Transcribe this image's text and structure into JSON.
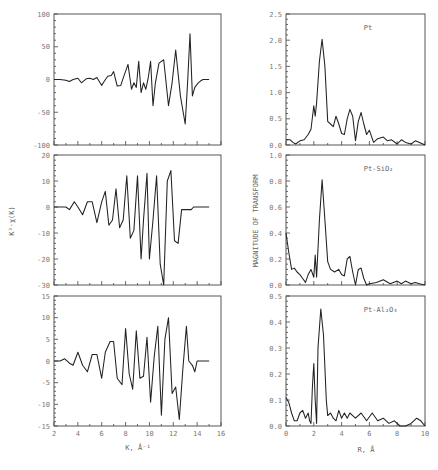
{
  "figure": {
    "left_column": {
      "y_axis_title": "K³·χ(K)",
      "x_axis_title": "K, Å⁻¹"
    },
    "right_column": {
      "y_axis_title": "MAGNITUDE OF TRANSFORM",
      "x_axis_title": "R, Å"
    }
  },
  "chart_data": [
    {
      "type": "line",
      "title": "",
      "panel": "left-top",
      "xlabel": "K, Å⁻¹",
      "ylabel": "K³·χ(K)",
      "xlim": [
        2,
        16
      ],
      "ylim": [
        -100,
        100
      ],
      "xticks": [
        2,
        4,
        6,
        8,
        10,
        12,
        14,
        16
      ],
      "yticks": [
        -100,
        -50,
        0,
        50,
        100
      ],
      "grid": false,
      "x": [
        2.0,
        2.5,
        3.0,
        3.3,
        3.6,
        4.0,
        4.3,
        4.7,
        5.0,
        5.3,
        5.6,
        6.0,
        6.2,
        6.5,
        6.8,
        7.0,
        7.3,
        7.6,
        7.8,
        8.2,
        8.5,
        8.7,
        8.9,
        9.1,
        9.3,
        9.5,
        9.7,
        9.9,
        10.1,
        10.3,
        10.5,
        10.8,
        11.2,
        11.6,
        11.9,
        12.2,
        12.6,
        13.0,
        13.2,
        13.4,
        13.6,
        13.8,
        14.1,
        14.3,
        14.5,
        14.7,
        15.0
      ],
      "y": [
        0,
        0,
        -1,
        -3,
        0,
        2,
        -5,
        1,
        2,
        0,
        3,
        -9,
        -3,
        5,
        6,
        12,
        -10,
        -9,
        2,
        23,
        -15,
        -5,
        -12,
        28,
        -20,
        -5,
        -15,
        2,
        28,
        -40,
        -5,
        25,
        30,
        -40,
        -5,
        45,
        -25,
        -68,
        -5,
        70,
        -25,
        -12,
        -5,
        -2,
        0,
        0,
        0
      ],
      "series_name": "Pt"
    },
    {
      "type": "line",
      "panel": "left-middle",
      "xlabel": "K, Å⁻¹",
      "ylabel": "K³·χ(K)",
      "xlim": [
        2,
        16
      ],
      "ylim": [
        -30,
        20
      ],
      "xticks": [
        2,
        4,
        6,
        8,
        10,
        12,
        14,
        16
      ],
      "yticks": [
        -30,
        -20,
        -10,
        0,
        10,
        20
      ],
      "grid": false,
      "x": [
        2.0,
        2.5,
        3.0,
        3.3,
        3.7,
        4.0,
        4.4,
        4.8,
        5.2,
        5.6,
        6.0,
        6.3,
        6.6,
        6.9,
        7.2,
        7.5,
        7.8,
        8.1,
        8.4,
        8.7,
        9.0,
        9.3,
        9.5,
        9.8,
        10.0,
        10.3,
        10.6,
        10.9,
        11.2,
        11.5,
        11.8,
        12.1,
        12.4,
        12.7,
        13.0,
        13.2,
        13.5,
        13.7,
        13.9,
        14.1,
        14.3,
        14.5,
        14.7,
        15.0
      ],
      "y": [
        0,
        0,
        0,
        -1,
        2,
        0,
        -3,
        2,
        2,
        -6,
        2,
        6,
        -7,
        -5,
        7,
        -8,
        -5,
        12,
        -12,
        -9,
        12,
        -20,
        -5,
        13,
        -20,
        -5,
        12,
        -22,
        -30,
        10,
        14,
        -13,
        -14,
        -1,
        -1,
        -1,
        -1,
        0,
        0,
        0,
        0,
        0,
        0,
        0
      ],
      "series_name": "Pt-SiO₂"
    },
    {
      "type": "line",
      "panel": "left-bottom",
      "xlabel": "K, Å⁻¹",
      "ylabel": "K³·χ(K)",
      "xlim": [
        2,
        16
      ],
      "ylim": [
        -15,
        15
      ],
      "xticks": [
        2,
        4,
        6,
        8,
        10,
        12,
        14,
        16
      ],
      "yticks": [
        -15,
        -10,
        -5,
        0,
        5,
        10,
        15
      ],
      "grid": false,
      "x": [
        2.0,
        2.5,
        2.9,
        3.3,
        3.6,
        4.0,
        4.4,
        4.8,
        5.2,
        5.6,
        6.0,
        6.3,
        6.7,
        7.0,
        7.3,
        7.7,
        8.0,
        8.3,
        8.6,
        8.9,
        9.2,
        9.5,
        9.8,
        10.1,
        10.4,
        10.7,
        11.0,
        11.3,
        11.6,
        11.9,
        12.2,
        12.5,
        12.8,
        13.1,
        13.3,
        13.6,
        13.8,
        14.0,
        14.2,
        14.4,
        14.6,
        14.8,
        15.0
      ],
      "y": [
        0,
        0,
        0.5,
        -0.5,
        -1,
        2,
        -1,
        -2.5,
        1.5,
        1.5,
        -4,
        2,
        4.5,
        4.5,
        -4,
        -5.5,
        7.5,
        -3,
        -6.5,
        7,
        -4,
        -3.5,
        5.5,
        -9.5,
        1,
        8,
        -12.5,
        5,
        10,
        -7.5,
        -6,
        -13.5,
        -2,
        8,
        0,
        -1,
        -2.5,
        0,
        0,
        0,
        0,
        0,
        0
      ],
      "series_name": "Pt-Al₂O₃"
    },
    {
      "type": "line",
      "panel": "right-top",
      "label": "Pt",
      "xlabel": "R, Å",
      "ylabel": "MAGNITUDE OF TRANSFORM",
      "xlim": [
        0,
        10
      ],
      "ylim": [
        0,
        2.5
      ],
      "xticks": [
        0,
        2,
        4,
        6,
        8,
        10
      ],
      "yticks": [
        0.0,
        0.5,
        1.0,
        1.5,
        2.0,
        2.5
      ],
      "grid": false,
      "x": [
        0.0,
        0.3,
        0.5,
        0.7,
        1.0,
        1.3,
        1.6,
        1.8,
        2.0,
        2.1,
        2.2,
        2.4,
        2.6,
        2.8,
        3.0,
        3.2,
        3.4,
        3.6,
        3.8,
        4.0,
        4.2,
        4.4,
        4.6,
        4.8,
        5.0,
        5.2,
        5.4,
        5.6,
        5.8,
        6.0,
        6.3,
        6.6,
        7.0,
        7.3,
        7.6,
        8.0,
        8.3,
        8.6,
        9.0,
        9.3,
        9.6,
        10.0
      ],
      "y": [
        0.1,
        0.1,
        0.05,
        0.02,
        0.08,
        0.1,
        0.2,
        0.3,
        0.75,
        0.55,
        0.8,
        1.6,
        2.02,
        1.5,
        0.45,
        0.4,
        0.35,
        0.55,
        0.4,
        0.22,
        0.2,
        0.5,
        0.68,
        0.55,
        0.08,
        0.45,
        0.62,
        0.4,
        0.2,
        0.28,
        0.05,
        0.12,
        0.15,
        0.08,
        0.1,
        0.02,
        0.1,
        0.05,
        0.02,
        0.08,
        0.05,
        0.0
      ],
      "series_name": "Pt"
    },
    {
      "type": "line",
      "panel": "right-middle",
      "label": "Pt-SiO₂",
      "xlabel": "R, Å",
      "ylabel": "MAGNITUDE OF TRANSFORM",
      "xlim": [
        0,
        10
      ],
      "ylim": [
        0,
        1.0
      ],
      "xticks": [
        0,
        2,
        4,
        6,
        8,
        10
      ],
      "yticks": [
        0.0,
        0.2,
        0.4,
        0.6,
        0.8,
        1.0
      ],
      "grid": false,
      "x": [
        0.0,
        0.2,
        0.4,
        0.6,
        0.8,
        1.0,
        1.2,
        1.4,
        1.6,
        1.8,
        2.0,
        2.1,
        2.2,
        2.4,
        2.6,
        2.8,
        3.0,
        3.2,
        3.5,
        3.8,
        4.0,
        4.2,
        4.4,
        4.6,
        4.8,
        5.0,
        5.2,
        5.4,
        5.6,
        5.8,
        6.0,
        6.5,
        7.0,
        7.5,
        8.0,
        8.3,
        8.6,
        9.0,
        9.3,
        9.6,
        10.0
      ],
      "y": [
        0.4,
        0.25,
        0.12,
        0.13,
        0.1,
        0.08,
        0.05,
        0.02,
        0.08,
        0.12,
        0.06,
        0.23,
        0.06,
        0.5,
        0.81,
        0.5,
        0.18,
        0.12,
        0.1,
        0.12,
        0.08,
        0.07,
        0.2,
        0.22,
        0.1,
        0.0,
        0.12,
        0.13,
        0.05,
        0.0,
        0.01,
        0.02,
        0.04,
        0.01,
        0.03,
        0.01,
        0.03,
        0.01,
        0.02,
        0.01,
        0.0
      ],
      "series_name": "Pt-SiO₂"
    },
    {
      "type": "line",
      "panel": "right-bottom",
      "label": "Pt-Al₂O₃",
      "xlabel": "R, Å",
      "ylabel": "MAGNITUDE OF TRANSFORM",
      "xlim": [
        0,
        10
      ],
      "ylim": [
        0,
        0.5
      ],
      "xticks": [
        0,
        2,
        4,
        6,
        8,
        10
      ],
      "yticks": [
        0.0,
        0.1,
        0.2,
        0.3,
        0.4,
        0.5
      ],
      "grid": false,
      "x": [
        0.0,
        0.2,
        0.4,
        0.6,
        0.8,
        1.0,
        1.2,
        1.4,
        1.6,
        1.7,
        1.8,
        1.9,
        2.0,
        2.1,
        2.2,
        2.3,
        2.5,
        2.7,
        2.9,
        3.0,
        3.2,
        3.4,
        3.6,
        3.8,
        4.0,
        4.2,
        4.4,
        4.6,
        4.8,
        5.0,
        5.4,
        5.8,
        6.2,
        6.6,
        7.0,
        7.4,
        7.8,
        8.2,
        8.6,
        9.0,
        9.4,
        9.7,
        10.0
      ],
      "y": [
        0.11,
        0.09,
        0.05,
        0.02,
        0.02,
        0.05,
        0.06,
        0.03,
        0.05,
        0.02,
        0.01,
        0.15,
        0.24,
        0.1,
        0.01,
        0.3,
        0.45,
        0.35,
        0.1,
        0.04,
        0.05,
        0.03,
        0.02,
        0.06,
        0.03,
        0.05,
        0.03,
        0.05,
        0.04,
        0.03,
        0.05,
        0.02,
        0.05,
        0.02,
        0.03,
        0.01,
        0.02,
        0.0,
        0.0,
        0.01,
        0.03,
        0.02,
        0.0
      ],
      "series_name": "Pt-Al₂O₃"
    }
  ]
}
